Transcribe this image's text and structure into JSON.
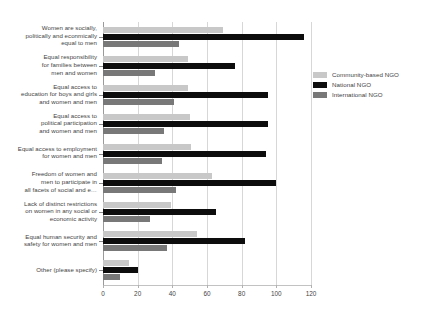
{
  "title_fragment": "",
  "chart_data": {
    "type": "bar",
    "orientation": "horizontal",
    "title": "",
    "xlabel": "",
    "ylabel": "",
    "xlim": [
      0,
      120
    ],
    "xticks": [
      0,
      20,
      40,
      60,
      80,
      100,
      120
    ],
    "grid": "vertical",
    "legend_position": "right",
    "categories": [
      "Women are socially, politically and econmically equal to men",
      "Equal responsibility for families between men and women",
      "Equal access to education for boys and girls and women and men",
      "Equal access to political participation and women and men",
      "Equal access to employment for women and men",
      "Freedom of women and men to participate in all facets of social and e…",
      "Lack of distinct restrictions on women in any social or economic activity",
      "Equal human security and safety for women and men",
      "Other (please specify)"
    ],
    "category_lines": [
      [
        "Women are socially,",
        "politically and econmically",
        "equal to men"
      ],
      [
        "Equal responsibility",
        "for families between",
        "men and women"
      ],
      [
        "Equal access to",
        "education for boys and girls",
        "and women and men"
      ],
      [
        "Equal access to",
        "political participation",
        "and women and men"
      ],
      [
        "Equal access to employment",
        "for women and men"
      ],
      [
        "Freedom of women and",
        "men to participate in",
        "all facets of social and e…"
      ],
      [
        "Lack of distinct restrictions",
        "on women in any social or",
        "economic activity"
      ],
      [
        "Equal human security and",
        "safety for women and men"
      ],
      [
        "Other (please specify)"
      ]
    ],
    "series": [
      {
        "name": "Community-based NGO",
        "color": "#c8c8c8",
        "values": [
          69,
          49,
          49,
          50,
          51,
          63,
          39,
          54,
          15
        ]
      },
      {
        "name": "National NGO",
        "color": "#0d0d0d",
        "values": [
          116,
          76,
          95,
          95,
          94,
          100,
          65,
          82,
          20
        ]
      },
      {
        "name": "International NGO",
        "color": "#787878",
        "values": [
          44,
          30,
          41,
          35,
          34,
          42,
          27,
          37,
          10
        ]
      }
    ]
  }
}
